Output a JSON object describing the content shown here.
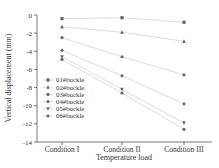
{
  "chart_data": {
    "type": "line",
    "title": "",
    "xlabel": "Temperature load",
    "ylabel": "Vertical displacement (mm)",
    "categories": [
      "Condition I",
      "Condition II",
      "Condition III"
    ],
    "ylim": [
      -14,
      0
    ],
    "yticks": [
      0,
      -2,
      -4,
      -6,
      -8,
      -10,
      -12,
      -14
    ],
    "grid": false,
    "legend_position": "lower-left inside",
    "series": [
      {
        "name": "01#buckle",
        "marker": "square",
        "values": [
          -0.4,
          -0.3,
          -0.8
        ]
      },
      {
        "name": "02#buckle",
        "marker": "triangle",
        "values": [
          -1.3,
          -1.9,
          -2.9
        ]
      },
      {
        "name": "03#buckle",
        "marker": "circle",
        "values": [
          -2.5,
          -4.6,
          -6.6
        ]
      },
      {
        "name": "04#buckle",
        "marker": "diamond",
        "values": [
          -3.9,
          -6.7,
          -9.8
        ]
      },
      {
        "name": "05#buckle",
        "marker": "triangle-down",
        "values": [
          -4.6,
          -8.2,
          -11.9
        ]
      },
      {
        "name": "06#buckle",
        "marker": "star",
        "values": [
          -4.9,
          -8.6,
          -12.6
        ]
      }
    ]
  }
}
